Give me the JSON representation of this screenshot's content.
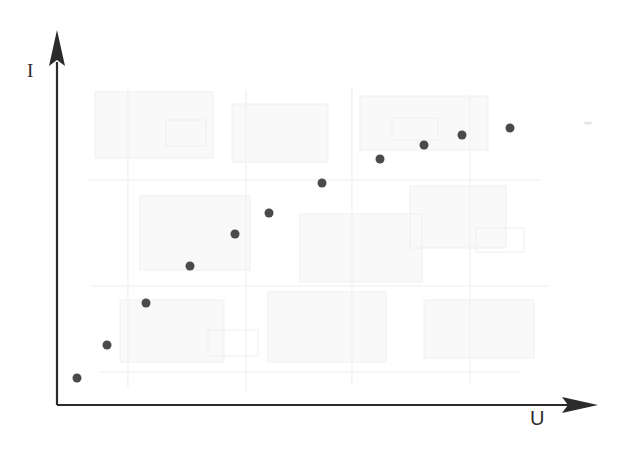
{
  "figure": {
    "width": 627,
    "height": 457,
    "background_color": "#ffffff",
    "ink_color": "#2b2b2b",
    "marker_color": "#4a4a4a"
  },
  "axes": {
    "y_axis": {
      "label": "I",
      "label_x": 32,
      "label_y": 72,
      "line_x": 57,
      "line_top_y": 62,
      "line_bottom_y": 405,
      "arrow_tip_y": 30,
      "arrow_half_width": 8,
      "has_arrow": true,
      "has_ticks": false,
      "has_tick_labels": false
    },
    "x_axis": {
      "label": "U",
      "label_x": 537,
      "label_y": 420,
      "line_y": 405,
      "line_left_x": 57,
      "line_right_x": 578,
      "arrow_tip_x": 598,
      "arrow_half_height": 8,
      "has_arrow": true,
      "has_ticks": false,
      "has_tick_labels": false
    },
    "line_width": 2.2
  },
  "chart_data": {
    "type": "scatter",
    "title": "",
    "xlabel": "U",
    "ylabel": "I",
    "grid": false,
    "legend": null,
    "marker": {
      "shape": "circle",
      "diameter_px": 9,
      "color": "#4a4a4a"
    },
    "note": "Current I plotted against voltage U; monotonically increasing, concave-down (saturating) trend. Axes carry no numeric tick labels, so values are normalized 0-1 fractions of the drawn axis lengths.",
    "x": [
      0.038,
      0.096,
      0.171,
      0.255,
      0.342,
      0.407,
      0.509,
      0.62,
      0.704,
      0.777,
      0.87
    ],
    "y": [
      0.079,
      0.175,
      0.297,
      0.405,
      0.496,
      0.557,
      0.645,
      0.715,
      0.758,
      0.787,
      0.807
    ],
    "points_px": [
      {
        "index": 1,
        "cx": 77,
        "cy": 378
      },
      {
        "index": 2,
        "cx": 107,
        "cy": 345
      },
      {
        "index": 3,
        "cx": 146,
        "cy": 303
      },
      {
        "index": 4,
        "cx": 190,
        "cy": 266
      },
      {
        "index": 5,
        "cx": 235,
        "cy": 234
      },
      {
        "index": 6,
        "cx": 269,
        "cy": 213
      },
      {
        "index": 7,
        "cx": 322,
        "cy": 183
      },
      {
        "index": 8,
        "cx": 380,
        "cy": 159
      },
      {
        "index": 9,
        "cx": 424,
        "cy": 145
      },
      {
        "index": 10,
        "cx": 462,
        "cy": 135
      },
      {
        "index": 11,
        "cx": 510,
        "cy": 128
      }
    ],
    "xlim": [
      0,
      1
    ],
    "ylim": [
      0,
      1
    ]
  },
  "artifacts": {
    "description": "Faint rectangular bleed-through pattern from the reverse side of the scanned page",
    "speck": {
      "cx": 588,
      "cy": 123,
      "rx": 4,
      "ry": 1.5,
      "color": "#e8e6e4"
    }
  }
}
